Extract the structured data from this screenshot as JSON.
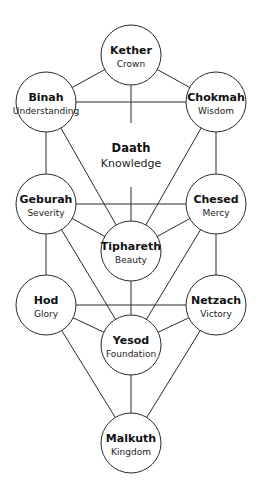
{
  "diagram": {
    "colors": {
      "background": "#ffffff",
      "stroke": "#2a2a2a",
      "text": "#111111"
    },
    "node_radius": 30,
    "nodes": {
      "kether": {
        "name": "Kether",
        "meaning": "Crown",
        "cx": 131,
        "cy": 55
      },
      "binah": {
        "name": "Binah",
        "meaning": "Understanding",
        "cx": 46,
        "cy": 102
      },
      "chokmah": {
        "name": "Chokmah",
        "meaning": "Wisdom",
        "cx": 216,
        "cy": 102
      },
      "geburah": {
        "name": "Geburah",
        "meaning": "Severity",
        "cx": 46,
        "cy": 204
      },
      "chesed": {
        "name": "Chesed",
        "meaning": "Mercy",
        "cx": 216,
        "cy": 204
      },
      "tiphareth": {
        "name": "Tiphareth",
        "meaning": "Beauty",
        "cx": 131,
        "cy": 251
      },
      "hod": {
        "name": "Hod",
        "meaning": "Glory",
        "cx": 46,
        "cy": 305
      },
      "netzach": {
        "name": "Netzach",
        "meaning": "Victory",
        "cx": 216,
        "cy": 305
      },
      "yesod": {
        "name": "Yesod",
        "meaning": "Foundation",
        "cx": 131,
        "cy": 345
      },
      "malkuth": {
        "name": "Malkuth",
        "meaning": "Kingdom",
        "cx": 131,
        "cy": 443
      }
    },
    "daath": {
      "name": "Daath",
      "meaning": "Knowledge",
      "cx": 131,
      "cy": 155,
      "has_circle": false
    },
    "edges": [
      [
        "kether",
        "binah"
      ],
      [
        "kether",
        "chokmah"
      ],
      [
        "kether",
        "tiphareth"
      ],
      [
        "binah",
        "chokmah"
      ],
      [
        "binah",
        "geburah"
      ],
      [
        "binah",
        "tiphareth"
      ],
      [
        "chokmah",
        "chesed"
      ],
      [
        "chokmah",
        "tiphareth"
      ],
      [
        "geburah",
        "chesed"
      ],
      [
        "geburah",
        "tiphareth"
      ],
      [
        "chesed",
        "tiphareth"
      ],
      [
        "geburah",
        "hod"
      ],
      [
        "chesed",
        "netzach"
      ],
      [
        "geburah",
        "yesod"
      ],
      [
        "chesed",
        "yesod"
      ],
      [
        "tiphareth",
        "yesod"
      ],
      [
        "hod",
        "netzach"
      ],
      [
        "hod",
        "yesod"
      ],
      [
        "netzach",
        "yesod"
      ],
      [
        "hod",
        "malkuth"
      ],
      [
        "netzach",
        "malkuth"
      ],
      [
        "yesod",
        "malkuth"
      ]
    ]
  }
}
